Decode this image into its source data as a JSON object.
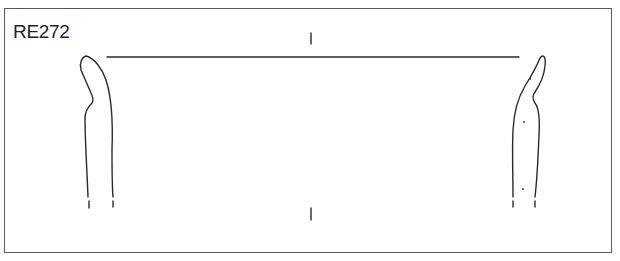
{
  "drawing": {
    "id_label": "RE272",
    "type": "pottery-profile-section",
    "elements": [
      "rim-diameter-line",
      "centre-axis-marks",
      "left-profile",
      "right-profile",
      "inclusion-dots"
    ]
  },
  "colors": {
    "line": "#2a2a2a",
    "frame": "#5a5a5a",
    "background": "#ffffff"
  }
}
